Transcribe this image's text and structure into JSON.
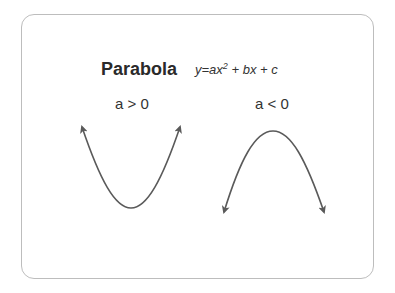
{
  "diagram": {
    "title": "Parabola",
    "formula": {
      "prefix": "y=ax",
      "exponent": "2",
      "suffix": " + bx + c"
    },
    "cases": [
      {
        "label": "a > 0",
        "shape": "opens-upward"
      },
      {
        "label": "a < 0",
        "shape": "opens-downward"
      }
    ],
    "colors": {
      "curve": "#5a5a5a",
      "border": "#bdbdbd",
      "text": "#2a2a2a"
    }
  }
}
